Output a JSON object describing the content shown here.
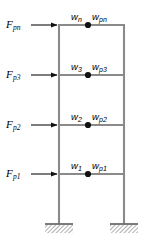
{
  "diagram": {
    "colors": {
      "member": "#8a8a8a",
      "node": "#111111",
      "text": "#000000",
      "arrow": "#111111",
      "hatch": "#6e6e6e",
      "background": "#ffffff"
    },
    "geometry": {
      "left_column_x": 59,
      "right_column_x": 124,
      "beam_y": [
        25,
        75,
        125,
        174
      ],
      "node_x": 88,
      "base_y": 224,
      "arrow_start_x": 30,
      "arrow_end_x": 58
    },
    "levels": [
      {
        "id": "level-n",
        "force_symbol": "F",
        "force_subscript": "pn",
        "mass_symbol": "w",
        "mass_subscript": "n",
        "weight_symbol": "w",
        "weight_subscript": "pn",
        "beam_y": 25
      },
      {
        "id": "level-3",
        "force_symbol": "F",
        "force_subscript": "p3",
        "mass_symbol": "w",
        "mass_subscript": "3",
        "weight_symbol": "w",
        "weight_subscript": "p3",
        "beam_y": 75
      },
      {
        "id": "level-2",
        "force_symbol": "F",
        "force_subscript": "p2",
        "mass_symbol": "w",
        "mass_subscript": "2",
        "weight_symbol": "w",
        "weight_subscript": "p2",
        "beam_y": 125
      },
      {
        "id": "level-1",
        "force_symbol": "F",
        "force_subscript": "p1",
        "mass_symbol": "w",
        "mass_subscript": "1",
        "weight_symbol": "w",
        "weight_subscript": "p1",
        "beam_y": 174
      }
    ],
    "supports": [
      {
        "id": "support-left",
        "x": 59,
        "type": "fixed-hatched"
      },
      {
        "id": "support-right",
        "x": 124,
        "type": "fixed-hatched"
      }
    ]
  }
}
